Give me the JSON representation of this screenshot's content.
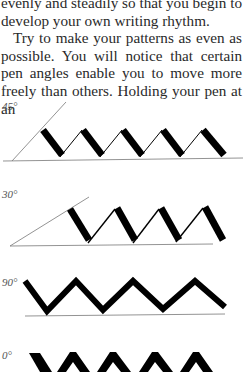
{
  "paragraphs": [
    {
      "text": "evenly and steadily so that you begin to develop your own writing rhythm.",
      "indent": false
    },
    {
      "text": "Try to make your patterns as even as possible. You will notice that certain pen angles enable you to move more freely than others. Holding your pen at an",
      "indent": true
    }
  ],
  "figures": [
    {
      "label": "45°",
      "angle_deg": 45
    },
    {
      "label": "30°",
      "angle_deg": 30
    },
    {
      "label": "90°",
      "angle_deg": 90
    },
    {
      "label": "0°",
      "angle_deg": 0
    }
  ],
  "colors": {
    "ink": "#000000",
    "guide_line": "#777777",
    "text": "#2a2a2a",
    "label": "#555555",
    "background": "#ffffff"
  }
}
